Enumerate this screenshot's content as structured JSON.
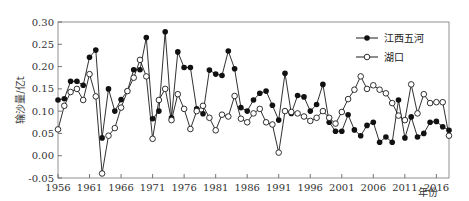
{
  "chart_data": {
    "type": "line",
    "title": "",
    "xlabel": "年份",
    "ylabel": "输沙量/亿t",
    "ylim": [
      -0.05,
      0.3
    ],
    "xlim": [
      1956,
      2018
    ],
    "grid": false,
    "legend_position": "top-right",
    "yticks": [
      "0.30",
      "0.25",
      "0.20",
      "0.15",
      "0.10",
      "0.05",
      "0.00",
      "-0.05"
    ],
    "ytick_values": [
      0.3,
      0.25,
      0.2,
      0.15,
      0.1,
      0.05,
      0.0,
      -0.05
    ],
    "xticks": [
      "1956",
      "1961",
      "1966",
      "1971",
      "1976",
      "1981",
      "1986",
      "1991",
      "1996",
      "2001",
      "2006",
      "2011",
      "2016"
    ],
    "xtick_values": [
      1956,
      1961,
      1966,
      1971,
      1976,
      1981,
      1986,
      1991,
      1996,
      2001,
      2006,
      2011,
      2016
    ],
    "x": [
      1956,
      1957,
      1958,
      1959,
      1960,
      1961,
      1962,
      1963,
      1964,
      1965,
      1966,
      1967,
      1968,
      1969,
      1970,
      1971,
      1972,
      1973,
      1974,
      1975,
      1976,
      1977,
      1978,
      1979,
      1980,
      1981,
      1982,
      1983,
      1984,
      1985,
      1986,
      1987,
      1988,
      1989,
      1990,
      1991,
      1992,
      1993,
      1994,
      1995,
      1996,
      1997,
      1998,
      1999,
      2000,
      2001,
      2002,
      2003,
      2004,
      2005,
      2006,
      2007,
      2008,
      2009,
      2010,
      2011,
      2012,
      2013,
      2014,
      2015,
      2016,
      2017,
      2018
    ],
    "series": [
      {
        "name": "江西五河",
        "marker": "filled-circle",
        "values": [
          0.125,
          0.128,
          0.167,
          0.167,
          0.158,
          0.221,
          0.237,
          0.04,
          0.15,
          0.1,
          0.126,
          0.145,
          0.193,
          0.193,
          0.265,
          0.083,
          0.1,
          0.278,
          0.085,
          0.233,
          0.198,
          0.198,
          0.105,
          0.094,
          0.192,
          0.183,
          0.18,
          0.235,
          0.195,
          0.108,
          0.1,
          0.125,
          0.14,
          0.145,
          0.113,
          0.08,
          0.185,
          0.095,
          0.135,
          0.132,
          0.1,
          0.115,
          0.16,
          0.075,
          0.055,
          0.055,
          0.092,
          0.058,
          0.045,
          0.068,
          0.075,
          0.03,
          0.042,
          0.03,
          0.125,
          0.04,
          0.087,
          0.042,
          0.05,
          0.075,
          0.077,
          0.065,
          0.057
        ]
      },
      {
        "name": "湖口",
        "marker": "open-circle",
        "values": [
          0.059,
          0.112,
          0.143,
          0.15,
          0.125,
          0.183,
          0.133,
          -0.04,
          0.045,
          0.062,
          0.108,
          0.145,
          0.175,
          0.215,
          0.178,
          0.038,
          0.125,
          0.15,
          0.08,
          0.138,
          0.105,
          0.06,
          0.1,
          0.112,
          0.085,
          0.057,
          0.092,
          0.088,
          0.134,
          0.083,
          0.075,
          0.095,
          0.105,
          0.075,
          0.07,
          0.007,
          0.1,
          0.098,
          0.095,
          0.088,
          0.078,
          0.085,
          0.1,
          0.085,
          0.072,
          0.098,
          0.127,
          0.148,
          0.178,
          0.15,
          0.158,
          0.148,
          0.14,
          0.118,
          0.09,
          0.08,
          0.16,
          0.095,
          0.138,
          0.118,
          0.12,
          0.12,
          0.045
        ]
      }
    ]
  },
  "legend": {
    "items": [
      {
        "label": "江西五河",
        "marker": "filled-circle"
      },
      {
        "label": "湖口",
        "marker": "open-circle"
      }
    ]
  },
  "colors": {
    "line": "#1a1a1a",
    "axis": "#555555",
    "filled_marker": "#111111",
    "open_marker_fill": "#ffffff"
  }
}
